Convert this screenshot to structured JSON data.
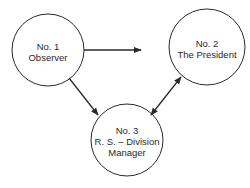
{
  "diagram": {
    "nodes": [
      {
        "id": "no1",
        "number": "No. 1",
        "lines": [
          "Observer"
        ],
        "cx": 48,
        "cy": 50,
        "r": 36
      },
      {
        "id": "no2",
        "number": "No. 2",
        "lines": [
          "The President"
        ],
        "cx": 207,
        "cy": 47,
        "r": 38
      },
      {
        "id": "no3",
        "number": "No. 3",
        "lines": [
          "R. S. – Division",
          "Manager"
        ],
        "cx": 127,
        "cy": 140,
        "r": 36
      }
    ],
    "edges": [
      {
        "from": "no1",
        "to": "no2",
        "direction": "forward",
        "note": "arrow ends short of No. 2"
      },
      {
        "from": "no1",
        "to": "no3",
        "direction": "forward"
      },
      {
        "from": "no3",
        "to": "no2",
        "direction": "both"
      }
    ],
    "colors": {
      "stroke": "#2a2a2a",
      "background": "#ffffff"
    }
  }
}
